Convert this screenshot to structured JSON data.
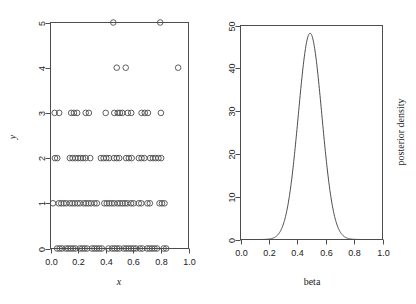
{
  "figure": {
    "background": "#ffffff",
    "foreground": "#4d4d4d",
    "panel_count": 2
  },
  "chart_data": [
    {
      "type": "scatter",
      "panel": "left",
      "title": "",
      "xlabel": "x",
      "ylabel": "y",
      "xlim": [
        0.0,
        1.0
      ],
      "ylim": [
        0,
        5
      ],
      "grid": false,
      "legend": null,
      "xticks": [
        0.0,
        0.2,
        0.4,
        0.6,
        0.8,
        1.0
      ],
      "xticklabels": [
        "0.0",
        "0.2",
        "0.4",
        "0.6",
        "0.8",
        "1.0"
      ],
      "yticks": [
        0,
        1,
        2,
        3,
        4,
        5
      ],
      "yticklabels": [
        "0",
        "1",
        "2",
        "3",
        "4",
        "5"
      ],
      "marker": "open-circle",
      "marker_size": 4,
      "points": [
        {
          "x": 0.455,
          "y": 5
        },
        {
          "x": 0.795,
          "y": 5
        },
        {
          "x": 0.48,
          "y": 4
        },
        {
          "x": 0.545,
          "y": 4
        },
        {
          "x": 0.925,
          "y": 4
        },
        {
          "x": 0.03,
          "y": 3
        },
        {
          "x": 0.063,
          "y": 3
        },
        {
          "x": 0.15,
          "y": 3
        },
        {
          "x": 0.17,
          "y": 3
        },
        {
          "x": 0.193,
          "y": 3
        },
        {
          "x": 0.255,
          "y": 3
        },
        {
          "x": 0.278,
          "y": 3
        },
        {
          "x": 0.4,
          "y": 3
        },
        {
          "x": 0.462,
          "y": 3
        },
        {
          "x": 0.487,
          "y": 3
        },
        {
          "x": 0.503,
          "y": 3
        },
        {
          "x": 0.52,
          "y": 3
        },
        {
          "x": 0.56,
          "y": 3
        },
        {
          "x": 0.585,
          "y": 3
        },
        {
          "x": 0.66,
          "y": 3
        },
        {
          "x": 0.683,
          "y": 3
        },
        {
          "x": 0.706,
          "y": 3
        },
        {
          "x": 0.8,
          "y": 3
        },
        {
          "x": 0.032,
          "y": 2
        },
        {
          "x": 0.049,
          "y": 2
        },
        {
          "x": 0.14,
          "y": 2
        },
        {
          "x": 0.16,
          "y": 2
        },
        {
          "x": 0.18,
          "y": 2
        },
        {
          "x": 0.2,
          "y": 2
        },
        {
          "x": 0.218,
          "y": 2
        },
        {
          "x": 0.236,
          "y": 2
        },
        {
          "x": 0.255,
          "y": 2
        },
        {
          "x": 0.288,
          "y": 2
        },
        {
          "x": 0.365,
          "y": 2
        },
        {
          "x": 0.385,
          "y": 2
        },
        {
          "x": 0.404,
          "y": 2
        },
        {
          "x": 0.424,
          "y": 2
        },
        {
          "x": 0.46,
          "y": 2
        },
        {
          "x": 0.48,
          "y": 2
        },
        {
          "x": 0.498,
          "y": 2
        },
        {
          "x": 0.548,
          "y": 2
        },
        {
          "x": 0.568,
          "y": 2
        },
        {
          "x": 0.588,
          "y": 2
        },
        {
          "x": 0.64,
          "y": 2
        },
        {
          "x": 0.66,
          "y": 2
        },
        {
          "x": 0.68,
          "y": 2
        },
        {
          "x": 0.722,
          "y": 2
        },
        {
          "x": 0.742,
          "y": 2
        },
        {
          "x": 0.762,
          "y": 2
        },
        {
          "x": 0.782,
          "y": 2
        },
        {
          "x": 0.802,
          "y": 2
        },
        {
          "x": 0.018,
          "y": 1
        },
        {
          "x": 0.06,
          "y": 1
        },
        {
          "x": 0.078,
          "y": 1
        },
        {
          "x": 0.096,
          "y": 1
        },
        {
          "x": 0.114,
          "y": 1
        },
        {
          "x": 0.14,
          "y": 1
        },
        {
          "x": 0.158,
          "y": 1
        },
        {
          "x": 0.176,
          "y": 1
        },
        {
          "x": 0.196,
          "y": 1
        },
        {
          "x": 0.214,
          "y": 1
        },
        {
          "x": 0.24,
          "y": 1
        },
        {
          "x": 0.258,
          "y": 1
        },
        {
          "x": 0.276,
          "y": 1
        },
        {
          "x": 0.294,
          "y": 1
        },
        {
          "x": 0.318,
          "y": 1
        },
        {
          "x": 0.336,
          "y": 1
        },
        {
          "x": 0.39,
          "y": 1
        },
        {
          "x": 0.408,
          "y": 1
        },
        {
          "x": 0.426,
          "y": 1
        },
        {
          "x": 0.444,
          "y": 1
        },
        {
          "x": 0.462,
          "y": 1
        },
        {
          "x": 0.486,
          "y": 1
        },
        {
          "x": 0.504,
          "y": 1
        },
        {
          "x": 0.522,
          "y": 1
        },
        {
          "x": 0.54,
          "y": 1
        },
        {
          "x": 0.558,
          "y": 1
        },
        {
          "x": 0.584,
          "y": 1
        },
        {
          "x": 0.602,
          "y": 1
        },
        {
          "x": 0.64,
          "y": 1
        },
        {
          "x": 0.658,
          "y": 1
        },
        {
          "x": 0.702,
          "y": 1
        },
        {
          "x": 0.72,
          "y": 1
        },
        {
          "x": 0.79,
          "y": 1
        },
        {
          "x": 0.808,
          "y": 1
        },
        {
          "x": 0.826,
          "y": 1
        },
        {
          "x": 0.048,
          "y": 0
        },
        {
          "x": 0.066,
          "y": 0
        },
        {
          "x": 0.084,
          "y": 0
        },
        {
          "x": 0.11,
          "y": 0
        },
        {
          "x": 0.128,
          "y": 0
        },
        {
          "x": 0.146,
          "y": 0
        },
        {
          "x": 0.164,
          "y": 0
        },
        {
          "x": 0.182,
          "y": 0
        },
        {
          "x": 0.212,
          "y": 0
        },
        {
          "x": 0.23,
          "y": 0
        },
        {
          "x": 0.248,
          "y": 0
        },
        {
          "x": 0.266,
          "y": 0
        },
        {
          "x": 0.3,
          "y": 0
        },
        {
          "x": 0.318,
          "y": 0
        },
        {
          "x": 0.336,
          "y": 0
        },
        {
          "x": 0.354,
          "y": 0
        },
        {
          "x": 0.372,
          "y": 0
        },
        {
          "x": 0.42,
          "y": 0
        },
        {
          "x": 0.446,
          "y": 0
        },
        {
          "x": 0.464,
          "y": 0
        },
        {
          "x": 0.482,
          "y": 0
        },
        {
          "x": 0.5,
          "y": 0
        },
        {
          "x": 0.53,
          "y": 0
        },
        {
          "x": 0.548,
          "y": 0
        },
        {
          "x": 0.566,
          "y": 0
        },
        {
          "x": 0.584,
          "y": 0
        },
        {
          "x": 0.602,
          "y": 0
        },
        {
          "x": 0.62,
          "y": 0
        },
        {
          "x": 0.648,
          "y": 0
        },
        {
          "x": 0.666,
          "y": 0
        },
        {
          "x": 0.7,
          "y": 0
        },
        {
          "x": 0.718,
          "y": 0
        },
        {
          "x": 0.736,
          "y": 0
        },
        {
          "x": 0.754,
          "y": 0
        },
        {
          "x": 0.772,
          "y": 0
        },
        {
          "x": 0.82,
          "y": 0
        },
        {
          "x": 0.838,
          "y": 0
        }
      ]
    },
    {
      "type": "line",
      "panel": "right",
      "title": "",
      "xlabel": "beta",
      "ylabel": "posterior density",
      "xlim": [
        0.0,
        1.0
      ],
      "ylim": [
        0,
        50
      ],
      "grid": false,
      "legend": null,
      "xticks": [
        0.0,
        0.2,
        0.4,
        0.6,
        0.8,
        1.0
      ],
      "xticklabels": [
        "0.0",
        "0.2",
        "0.4",
        "0.6",
        "0.8",
        "1.0"
      ],
      "yticks": [
        0,
        10,
        20,
        30,
        40,
        50
      ],
      "yticklabels": [
        "0",
        "10",
        "20",
        "30",
        "40",
        "50"
      ],
      "peak": {
        "x": 0.49,
        "y": 48.2
      },
      "distribution": {
        "mean": 0.49,
        "sd": 0.0825
      },
      "series": [
        {
          "name": "posterior density",
          "x": [
            0.0,
            0.02,
            0.04,
            0.06,
            0.08,
            0.1,
            0.12,
            0.14,
            0.16,
            0.18,
            0.2,
            0.22,
            0.24,
            0.26,
            0.28,
            0.3,
            0.32,
            0.34,
            0.36,
            0.38,
            0.4,
            0.42,
            0.44,
            0.46,
            0.48,
            0.5,
            0.52,
            0.54,
            0.56,
            0.58,
            0.6,
            0.62,
            0.64,
            0.66,
            0.68,
            0.7,
            0.72,
            0.74,
            0.76,
            0.78,
            0.8,
            0.82,
            0.84,
            0.86,
            0.88,
            0.9,
            0.92,
            0.94,
            0.96,
            0.98,
            1.0
          ],
          "y": [
            0.0,
            0.0,
            0.0,
            0.0,
            0.0,
            0.0,
            0.01,
            0.04,
            0.14,
            0.43,
            1.15,
            2.67,
            5.43,
            9.67,
            15.1,
            20.67,
            27.72,
            34.02,
            40.0,
            44.52,
            47.0,
            48.16,
            48.2,
            48.2,
            48.15,
            47.6,
            45.5,
            42.3,
            37.4,
            31.6,
            25.4,
            19.3,
            13.9,
            9.4,
            6.0,
            3.6,
            2.0,
            1.05,
            0.52,
            0.24,
            0.1,
            0.04,
            0.02,
            0.01,
            0.0,
            0.0,
            0.0,
            0.0,
            0.0,
            0.0,
            0.0
          ]
        }
      ]
    }
  ],
  "left_panel": {
    "xlabel": "x",
    "ylabel": "y",
    "xticklabels": [
      "0.0",
      "0.2",
      "0.4",
      "0.6",
      "0.8",
      "1.0"
    ],
    "yticklabels": [
      "0",
      "1",
      "2",
      "3",
      "4",
      "5"
    ]
  },
  "right_panel": {
    "xlabel": "beta",
    "ylabel": "posterior density",
    "xticklabels": [
      "0.0",
      "0.2",
      "0.4",
      "0.6",
      "0.8",
      "1.0"
    ],
    "yticklabels": [
      "0",
      "10",
      "20",
      "30",
      "40",
      "50"
    ]
  }
}
